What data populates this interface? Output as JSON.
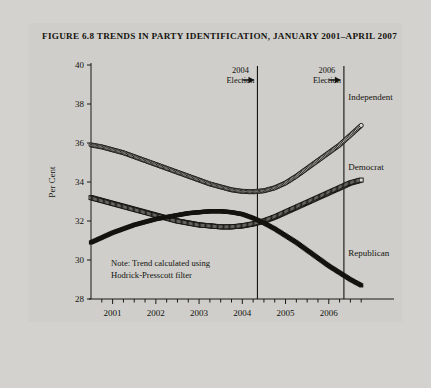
{
  "figure": {
    "title": "FIGURE 6.8 TRENDS IN PARTY IDENTIFICATION, JANUARY 2001–APRIL 2007",
    "note_line1": "Note: Trend calculated using",
    "note_line2": "Hodrick-Presscott filter",
    "source": "Source: Monthly Gallup surveys."
  },
  "annotations": [
    {
      "label_line1": "2004",
      "label_line2": "Election",
      "arrow": "right-arrow-icon",
      "x_value": 2004.35
    },
    {
      "label_line1": "2006",
      "label_line2": "Election",
      "arrow": "right-arrow-icon",
      "x_value": 2006.35
    }
  ],
  "chart_data": {
    "type": "line",
    "title": "FIGURE 6.8 TRENDS IN PARTY IDENTIFICATION, JANUARY 2001–APRIL 2007",
    "xlabel": "Date",
    "ylabel": "Per Cent",
    "ylim": [
      28,
      40
    ],
    "xlim": [
      2000.5,
      2007.0
    ],
    "ytick_labels": [
      "28",
      "30",
      "32",
      "34",
      "36",
      "38",
      "40"
    ],
    "yticks": [
      28,
      30,
      32,
      34,
      36,
      38,
      40
    ],
    "xtick_labels": [
      "2001",
      "2002",
      "2003",
      "2004",
      "2005",
      "2006"
    ],
    "xticks": [
      2001,
      2002,
      2003,
      2004,
      2005,
      2006
    ],
    "minor_xticks_per_year": 4,
    "grid": false,
    "legend": "inline-right-labels",
    "series": [
      {
        "name": "Independent",
        "marker": "open-circle",
        "label_x": 2006.45,
        "label_y": 38.2,
        "x": [
          2000.5,
          2000.75,
          2001.0,
          2001.25,
          2001.5,
          2001.75,
          2002.0,
          2002.25,
          2002.5,
          2002.75,
          2003.0,
          2003.25,
          2003.5,
          2003.75,
          2004.0,
          2004.25,
          2004.5,
          2004.75,
          2005.0,
          2005.25,
          2005.5,
          2005.75,
          2006.0,
          2006.25,
          2006.5,
          2006.75
        ],
        "y": [
          35.9,
          35.8,
          35.65,
          35.5,
          35.3,
          35.1,
          34.9,
          34.7,
          34.5,
          34.3,
          34.1,
          33.9,
          33.75,
          33.6,
          33.52,
          33.5,
          33.55,
          33.7,
          33.95,
          34.3,
          34.7,
          35.1,
          35.5,
          35.9,
          36.4,
          36.9
        ]
      },
      {
        "name": "Democrat",
        "marker": "open-square",
        "label_x": 2006.45,
        "label_y": 34.6,
        "x": [
          2000.5,
          2000.75,
          2001.0,
          2001.25,
          2001.5,
          2001.75,
          2002.0,
          2002.25,
          2002.5,
          2002.75,
          2003.0,
          2003.25,
          2003.5,
          2003.75,
          2004.0,
          2004.25,
          2004.5,
          2004.75,
          2005.0,
          2005.25,
          2005.5,
          2005.75,
          2006.0,
          2006.25,
          2006.5,
          2006.75
        ],
        "y": [
          33.2,
          33.05,
          32.9,
          32.75,
          32.6,
          32.45,
          32.3,
          32.15,
          32.0,
          31.9,
          31.8,
          31.75,
          31.7,
          31.7,
          31.75,
          31.85,
          32.0,
          32.2,
          32.45,
          32.7,
          32.95,
          33.2,
          33.45,
          33.7,
          33.95,
          34.1
        ]
      },
      {
        "name": "Republican",
        "marker": "filled-square",
        "label_x": 2006.45,
        "label_y": 30.2,
        "x": [
          2000.5,
          2000.75,
          2001.0,
          2001.25,
          2001.5,
          2001.75,
          2002.0,
          2002.25,
          2002.5,
          2002.75,
          2003.0,
          2003.25,
          2003.5,
          2003.75,
          2004.0,
          2004.25,
          2004.5,
          2004.75,
          2005.0,
          2005.25,
          2005.5,
          2005.75,
          2006.0,
          2006.25,
          2006.5,
          2006.75
        ],
        "y": [
          30.9,
          31.15,
          31.4,
          31.6,
          31.8,
          31.95,
          32.1,
          32.2,
          32.3,
          32.4,
          32.45,
          32.5,
          32.5,
          32.45,
          32.35,
          32.15,
          31.9,
          31.6,
          31.25,
          30.9,
          30.5,
          30.1,
          29.7,
          29.35,
          29.0,
          28.7
        ]
      }
    ]
  },
  "colors": {
    "background": "#d3d2cf",
    "figure_background": "#cfcecb",
    "ink": "#14130e"
  }
}
